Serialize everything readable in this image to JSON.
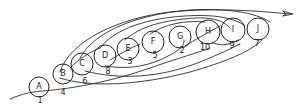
{
  "diagram": {
    "title": "",
    "style": "hand-drawn pencil sketch",
    "stroke_color": "#222222",
    "background": "#ffffff",
    "nodes": [
      {
        "letter": "A",
        "number": "1",
        "cx": 39,
        "cy": 87,
        "r": 10,
        "nx": 40,
        "ny": 101
      },
      {
        "letter": "B",
        "number": "4",
        "cx": 63,
        "cy": 74,
        "r": 10,
        "nx": 63,
        "ny": 93
      },
      {
        "letter": "C",
        "number": "6",
        "cx": 82,
        "cy": 64,
        "r": 11,
        "nx": 85,
        "ny": 82
      },
      {
        "letter": "D",
        "number": "8",
        "cx": 105,
        "cy": 56,
        "r": 11,
        "nx": 108,
        "ny": 72
      },
      {
        "letter": "E",
        "number": "3",
        "cx": 128,
        "cy": 49,
        "r": 11,
        "nx": 130,
        "ny": 62
      },
      {
        "letter": "F",
        "number": "5",
        "cx": 153,
        "cy": 42,
        "r": 11,
        "nx": 155,
        "ny": 56
      },
      {
        "letter": "G",
        "number": "2",
        "cx": 180,
        "cy": 37,
        "r": 11,
        "nx": 182,
        "ny": 51
      },
      {
        "letter": "H",
        "number": "10",
        "cx": 208,
        "cy": 32,
        "r": 12,
        "nx": 205,
        "ny": 48
      },
      {
        "letter": "I",
        "number": "9",
        "cx": 233,
        "cy": 30,
        "r": 12,
        "nx": 232,
        "ny": 46
      },
      {
        "letter": "J",
        "number": "7",
        "cx": 258,
        "cy": 29,
        "r": 11,
        "nx": 257,
        "ny": 44
      }
    ],
    "arrow": {
      "direction": "right",
      "tip_x": 293,
      "tip_y": 14
    }
  }
}
